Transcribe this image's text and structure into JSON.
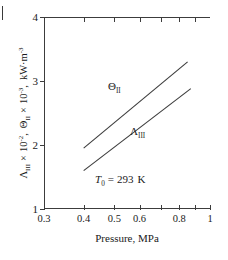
{
  "chart_data": {
    "type": "line",
    "title": "",
    "xlabel": "Pressure,  MPa",
    "ylabel": "Λₘ × 10⁻²,  Θₘ × 10⁻³,  kW·m⁻³",
    "ylabel_parts": {
      "lambda_symbol": "Λ",
      "lambda_sub": "III",
      "times1": "×",
      "pow1_base": "10",
      "pow1_exp": "-2",
      "comma1": ",",
      "theta_symbol": "Θ",
      "theta_sub": "II",
      "times2": "×",
      "pow2_base": "10",
      "pow2_exp": "-3",
      "comma2": ",",
      "units_base": "kW·m",
      "units_exp": "-3"
    },
    "xscale": "log",
    "yscale": "linear",
    "xlim": [
      0.3,
      1.0
    ],
    "ylim": [
      1,
      4
    ],
    "grid": false,
    "legend": "inline-curve-labels",
    "xticks": [
      0.3,
      0.4,
      0.5,
      0.6,
      0.8,
      1.0
    ],
    "xtick_labels": [
      "0.3",
      "0.4",
      "0.5",
      "0.6",
      "0.8",
      "1"
    ],
    "xticks_minor": [
      0.7,
      0.9
    ],
    "yticks": [
      1,
      2,
      3,
      4
    ],
    "ytick_labels": [
      "1",
      "2",
      "3",
      "4"
    ],
    "series": [
      {
        "name": "Θ₁₁",
        "label_symbol": "Θ",
        "label_sub": "II",
        "color": "#3c3c3c",
        "x": [
          0.4,
          0.85
        ],
        "y": [
          1.95,
          3.3
        ]
      },
      {
        "name": "Λ₁₁₁",
        "label_symbol": "Λ",
        "label_sub": "III",
        "color": "#3c3c3c",
        "x": [
          0.4,
          0.87
        ],
        "y": [
          1.6,
          2.88
        ]
      }
    ],
    "annotations": [
      {
        "name": "reference-temperature",
        "symbol": "T",
        "subscript": "0",
        "equals": "=",
        "value": "293",
        "unit": "K",
        "text": "T₀ = 293 K",
        "x": 0.44,
        "y": 1.27
      }
    ]
  },
  "axes": {
    "x_title": "Pressure,  MPa",
    "x_tick_labels": [
      "0.3",
      "0.4",
      "0.5",
      "0.6",
      "0.8",
      "1"
    ],
    "y_tick_labels": [
      "4",
      "3",
      "2",
      "1"
    ]
  },
  "colors": {
    "axis": "#3c3c3c",
    "data_line": "#3c3c3c",
    "text": "#1a1a1a",
    "background": "#ffffff"
  }
}
